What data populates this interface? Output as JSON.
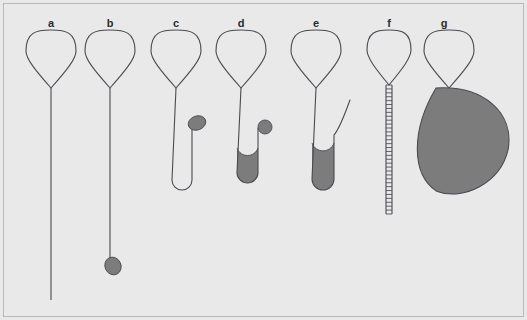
{
  "figure": {
    "background_color": "#e9e9e9",
    "border_color": "#b9b9bd",
    "stroke_color": "#4a4a52",
    "fill_color": "#7c7c7c",
    "panel_count": 7,
    "width": 527,
    "height": 320
  },
  "panels": [
    {
      "label": "a",
      "label_x": 51,
      "label_y": 17,
      "head_cx": 51,
      "head_top": 30,
      "head_bottom": 88,
      "head_halfwidth": 25,
      "description": "empty-loop-with-long-straight-tail",
      "tail_type": "straight",
      "tail_end_y": 300,
      "has_droplet": false,
      "has_fill": false
    },
    {
      "label": "b",
      "label_x": 110,
      "label_y": 17,
      "head_cx": 110,
      "head_top": 30,
      "head_bottom": 88,
      "head_halfwidth": 25,
      "description": "empty-loop-with-tail-ending-in-droplet",
      "tail_type": "straight",
      "tail_end_y": 258,
      "has_droplet": true,
      "droplet_cx": 113,
      "droplet_cy": 266,
      "droplet_rx": 8,
      "droplet_ry": 9,
      "droplet_rotation": -25,
      "has_fill": false
    },
    {
      "label": "c",
      "label_x": 176,
      "label_y": 17,
      "head_cx": 176,
      "head_top": 30,
      "head_bottom": 88,
      "head_halfwidth": 25,
      "description": "loop-with-unfilled-u-bend-and-side-oval",
      "tail_type": "u-bend",
      "u_left_x": 172,
      "u_right_x": 192,
      "u_bottom_y": 190,
      "u_right_top_y": 122,
      "has_fill": false,
      "has_droplet": true,
      "droplet_cx": 197,
      "droplet_cy": 123,
      "droplet_rx": 9,
      "droplet_ry": 7,
      "droplet_rotation": -20
    },
    {
      "label": "d",
      "label_x": 241,
      "label_y": 17,
      "head_cx": 241,
      "head_top": 30,
      "head_bottom": 88,
      "head_halfwidth": 25,
      "description": "loop-with-partly-filled-u-bend-and-side-circle",
      "tail_type": "u-bend",
      "u_left_x": 237,
      "u_right_x": 258,
      "u_bottom_y": 183,
      "u_right_top_y": 128,
      "has_fill": true,
      "fill_top_y": 148,
      "has_droplet": true,
      "droplet_cx": 265,
      "droplet_cy": 127,
      "droplet_rx": 7,
      "droplet_ry": 7,
      "droplet_rotation": 0
    },
    {
      "label": "e",
      "label_x": 316,
      "label_y": 17,
      "head_cx": 316,
      "head_top": 30,
      "head_bottom": 88,
      "head_halfwidth": 25,
      "description": "loop-with-filled-u-bend-and-curving-tail",
      "tail_type": "u-bend-curved",
      "u_left_x": 312,
      "u_right_x": 334,
      "u_bottom_y": 190,
      "has_fill": true,
      "fill_top_y": 143,
      "has_droplet": false,
      "curve_tip_x": 350,
      "curve_tip_y": 100
    },
    {
      "label": "f",
      "label_x": 389,
      "label_y": 17,
      "head_cx": 389,
      "head_top": 30,
      "head_bottom": 85,
      "head_halfwidth": 22,
      "description": "loop-with-ladder-coiled-tail",
      "tail_type": "ladder",
      "ladder_top_y": 85,
      "ladder_bottom_y": 214,
      "ladder_halfwidth": 3,
      "rung_count": 33,
      "has_fill": false,
      "has_droplet": false
    },
    {
      "label": "g",
      "label_x": 444,
      "label_y": 17,
      "head_cx": 449,
      "head_top": 30,
      "head_bottom": 88,
      "head_halfwidth": 25,
      "description": "loop-with-large-filled-teardrop-body",
      "tail_type": "none",
      "has_fill": true,
      "blob_cx": 461,
      "blob_cy": 140,
      "blob_rx": 49,
      "blob_ry": 55,
      "has_droplet": false
    }
  ]
}
